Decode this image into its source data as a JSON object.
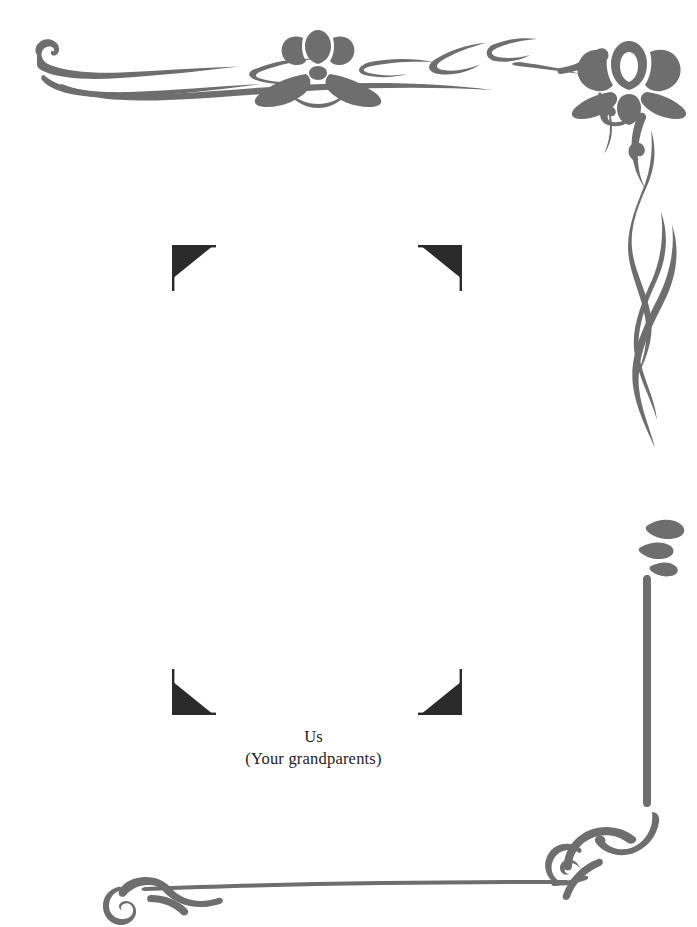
{
  "page": {
    "background_color": "#ffffff",
    "width": 697,
    "height": 927
  },
  "ornament": {
    "name": "art-nouveau-border",
    "stroke_color": "#6e6e6e",
    "motifs": [
      "lotus-flower-small",
      "lotus-flower-large",
      "ribbon-scroll",
      "leaf",
      "corner-curl"
    ],
    "edges": [
      "top",
      "right",
      "bottom"
    ]
  },
  "photo_frame": {
    "corner_mark_color": "#2b2b2b",
    "corners": [
      {
        "name": "photo-corner-top-left"
      },
      {
        "name": "photo-corner-top-right"
      },
      {
        "name": "photo-corner-bottom-left"
      },
      {
        "name": "photo-corner-bottom-right"
      }
    ]
  },
  "caption": {
    "line1": "Us",
    "line2": "(Your grandparents)",
    "text_color": "#1d1d1d"
  }
}
